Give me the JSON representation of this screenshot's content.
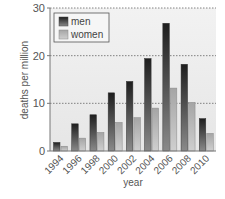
{
  "chart_data": {
    "type": "bar",
    "title": "",
    "xlabel": "year",
    "ylabel": "deaths per million",
    "categories": [
      "1994",
      "1996",
      "1998",
      "2000",
      "2002",
      "2004",
      "2006",
      "2008",
      "2010"
    ],
    "series": [
      {
        "name": "men",
        "values": [
          1.8,
          5.7,
          7.6,
          12.2,
          14.6,
          19.4,
          26.8,
          18.2,
          6.8
        ]
      },
      {
        "name": "women",
        "values": [
          1.0,
          2.7,
          3.9,
          6.0,
          7.0,
          9.0,
          13.2,
          10.2,
          3.7
        ]
      }
    ],
    "ylim": [
      0,
      30
    ],
    "yticks": [
      0,
      10,
      20,
      30
    ],
    "grid": "horizontal dashed",
    "legend_position": "top-left",
    "colors": {
      "men": "#2a2a2a",
      "women": "#b8b8b8",
      "plot_bg": "#ebebeb"
    }
  }
}
